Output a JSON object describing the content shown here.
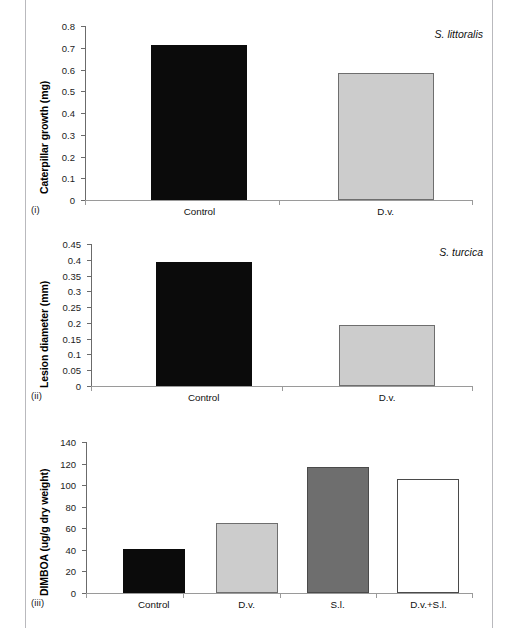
{
  "figure": {
    "panels": [
      {
        "id": "i",
        "panel_label": "(i)",
        "species": "S. littoralis",
        "ylabel": "Caterpillar growth (mg)"
      },
      {
        "id": "ii",
        "panel_label": "(ii)",
        "species": "S. turcica",
        "ylabel": "Lesion diameter (mm)"
      },
      {
        "id": "iii",
        "panel_label": "(iii)",
        "species": "",
        "ylabel": "DIMBOA (ug/g dry weight)"
      }
    ]
  },
  "chart_data": [
    {
      "type": "bar",
      "title": "",
      "annotation": "S. littoralis",
      "panel": "(i)",
      "xlabel": "",
      "ylabel": "Caterpillar growth (mg)",
      "ylim": [
        0,
        0.8
      ],
      "yticks": [
        "0",
        "0.1",
        "0.2",
        "0.3",
        "0.4",
        "0.5",
        "0.6",
        "0.7",
        "0.8"
      ],
      "ytick_values": [
        0,
        0.1,
        0.2,
        0.3,
        0.4,
        0.5,
        0.6,
        0.7,
        0.8
      ],
      "grid": false,
      "legend": "none",
      "categories": [
        "Control",
        "D.v."
      ],
      "values": [
        0.715,
        0.583
      ],
      "bar_colors": [
        "#0b0b0b",
        "#cccccc"
      ]
    },
    {
      "type": "bar",
      "title": "",
      "annotation": "S. turcica",
      "panel": "(ii)",
      "xlabel": "",
      "ylabel": "Lesion diameter (mm)",
      "ylim": [
        0,
        0.45
      ],
      "yticks": [
        "0",
        "0.05",
        "0.1",
        "0.15",
        "0.2",
        "0.25",
        "0.3",
        "0.35",
        "0.4",
        "0.45"
      ],
      "ytick_values": [
        0,
        0.05,
        0.1,
        0.15,
        0.2,
        0.25,
        0.3,
        0.35,
        0.4,
        0.45
      ],
      "grid": false,
      "legend": "none",
      "categories": [
        "Control",
        "D.v."
      ],
      "values": [
        0.393,
        0.194
      ],
      "bar_colors": [
        "#0b0b0b",
        "#cccccc"
      ]
    },
    {
      "type": "bar",
      "title": "",
      "annotation": "",
      "panel": "(iii)",
      "xlabel": "",
      "ylabel": "DIMBOA (ug/g dry weight)",
      "ylim": [
        0,
        140
      ],
      "yticks": [
        "0",
        "20",
        "40",
        "60",
        "80",
        "100",
        "120",
        "140"
      ],
      "ytick_values": [
        0,
        20,
        40,
        60,
        80,
        100,
        120,
        140
      ],
      "grid": false,
      "legend": "none",
      "categories": [
        "Control",
        "D.v.",
        "S.l.",
        "D.v.+S.l."
      ],
      "values": [
        41,
        64.5,
        117,
        106
      ],
      "bar_colors": [
        "#0b0b0b",
        "#cccccc",
        "#6e6e6e",
        "#ffffff"
      ]
    }
  ]
}
